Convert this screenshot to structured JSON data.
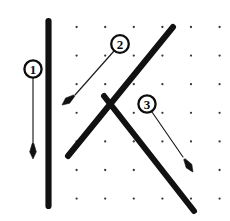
{
  "figure": {
    "canvas": {
      "width": 230,
      "height": 221,
      "background": "#ffffff"
    },
    "ink_color": "#111111",
    "grid": {
      "dot_color": "#3a3a3a",
      "dot_radius": 1.15,
      "spacing_x": 28.6,
      "spacing_y": 28.6,
      "origin_x": 48,
      "origin_y": 27,
      "columns": 7,
      "rows": 7
    },
    "segments": [
      {
        "name": "vertical-line",
        "label_ref": "1",
        "x1": 48.5,
        "y1": 21,
        "x2": 48.5,
        "y2": 206,
        "width": 6.2
      },
      {
        "name": "rising-diagonal",
        "label_ref": "2",
        "x1": 68,
        "y1": 156,
        "x2": 173,
        "y2": 27,
        "width": 6.0
      },
      {
        "name": "falling-diagonal",
        "label_ref": "3",
        "x1": 104,
        "y1": 96,
        "x2": 194,
        "y2": 211,
        "width": 6.0
      }
    ],
    "callouts": [
      {
        "id": "1",
        "text": "1",
        "circle_x": 33,
        "circle_y": 69,
        "circle_r": 8.6,
        "font_size": 13,
        "leader_x1": 33,
        "leader_y1": 78,
        "leader_x2": 33,
        "leader_y2": 146,
        "tip_x": 33,
        "tip_y": 159,
        "points_at": "vertical-line"
      },
      {
        "id": "2",
        "text": "2",
        "circle_x": 120,
        "circle_y": 44,
        "circle_r": 8.8,
        "font_size": 13,
        "leader_x1": 114,
        "leader_y1": 51,
        "leader_x2": 75,
        "leader_y2": 95,
        "tip_x": 62,
        "tip_y": 105,
        "points_at": "rising-diagonal"
      },
      {
        "id": "3",
        "text": "3",
        "circle_x": 147,
        "circle_y": 104,
        "circle_r": 8.6,
        "font_size": 13,
        "leader_x1": 152,
        "leader_y1": 112,
        "leader_x2": 183,
        "leader_y2": 157,
        "tip_x": 193,
        "tip_y": 172,
        "points_at": "falling-diagonal"
      }
    ]
  }
}
